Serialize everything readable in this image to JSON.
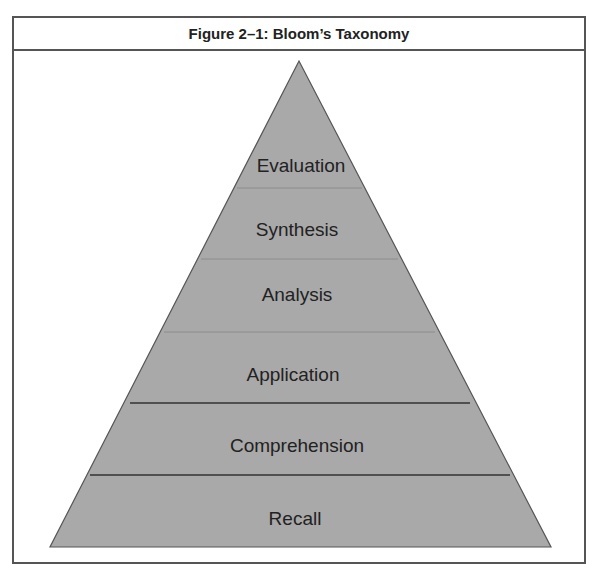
{
  "figure": {
    "title": "Figure 2–1: Bloom’s Taxonomy"
  },
  "pyramid": {
    "fill": "#a9a9a9",
    "levels_top_to_bottom": [
      {
        "label": "Evaluation"
      },
      {
        "label": "Synthesis"
      },
      {
        "label": "Analysis"
      },
      {
        "label": "Application"
      },
      {
        "label": "Comprehension"
      },
      {
        "label": "Recall"
      }
    ]
  }
}
